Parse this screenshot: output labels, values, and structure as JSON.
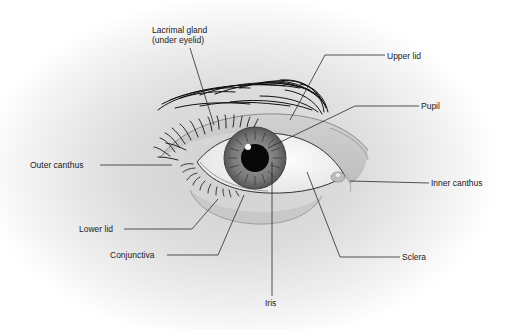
{
  "diagram": {
    "colors": {
      "background_shade": "#d6d6d6",
      "iris": "#7a7a7a",
      "pupil": "#0a0a0a",
      "sclera": "#f7f7f7",
      "leader_line": "#2a2a2a",
      "label_text": "#1a1a1a"
    },
    "labels": {
      "lacrimal_gland_line1": "Lacrimal gland",
      "lacrimal_gland_line2": "(under eyelid)",
      "upper_lid": "Upper lid",
      "pupil": "Pupil",
      "outer_canthus": "Outer canthus",
      "inner_canthus": "Inner canthus",
      "lower_lid": "Lower lid",
      "conjunctiva": "Conjunctiva",
      "sclera": "Sclera",
      "iris": "Iris"
    }
  }
}
